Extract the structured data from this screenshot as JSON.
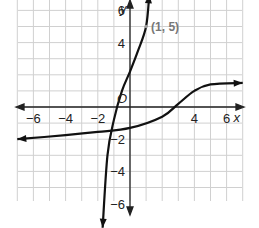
{
  "chart_data": {
    "type": "line",
    "title": "",
    "xlabel": "x",
    "ylabel": "y",
    "origin_label": "O",
    "xlim": [
      -7,
      7
    ],
    "ylim": [
      -7,
      7
    ],
    "grid": true,
    "x_ticks": [
      -6,
      -4,
      -2,
      4,
      6
    ],
    "y_ticks": [
      6,
      4,
      -2,
      -4,
      -6
    ],
    "x_tick_labels": [
      "−6",
      "−4",
      "−2",
      "4",
      "6"
    ],
    "y_tick_labels": [
      "6",
      "4",
      "−2",
      "−4",
      "−6"
    ],
    "annotations": [
      {
        "text": "(1, 5)",
        "x": 1,
        "y": 5
      }
    ],
    "series": [
      {
        "name": "steep curve",
        "points": [
          [
            -1.7,
            -7.5
          ],
          [
            -1.4,
            -3
          ],
          [
            -1,
            -0.8
          ],
          [
            -0.5,
            1
          ],
          [
            0,
            2.2
          ],
          [
            0.5,
            3.5
          ],
          [
            1,
            5
          ],
          [
            1.2,
            7
          ]
        ],
        "arrows": "both"
      },
      {
        "name": "flat curve",
        "points": [
          [
            -7,
            -2
          ],
          [
            -4,
            -1.75
          ],
          [
            -2,
            -1.55
          ],
          [
            0,
            -1.3
          ],
          [
            2,
            -0.6
          ],
          [
            3,
            0.2
          ],
          [
            4,
            1
          ],
          [
            5,
            1.4
          ],
          [
            7,
            1.5
          ]
        ],
        "arrows": "both"
      }
    ]
  },
  "labels": {
    "x_axis": "x",
    "y_axis": "y",
    "origin": "O",
    "point": "(1, 5)",
    "xt": [
      "−6",
      "−4",
      "−2",
      "4",
      "6"
    ],
    "yt": [
      "6",
      "4",
      "−2",
      "−4",
      "−6"
    ]
  }
}
